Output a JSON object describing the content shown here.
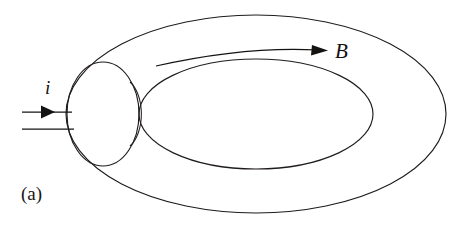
{
  "figure": {
    "kind": "physics-diagram",
    "panel_label": "(a)",
    "labels": {
      "current": "i",
      "field": "B"
    },
    "colors": {
      "background": "#ffffff",
      "outline": "#201c1b",
      "shading_light": "#dedede",
      "shading_mid": "#c8c8c8",
      "shading_dark": "#b4b4b4",
      "label": "#131010"
    },
    "annotations": {
      "current_arrow": "arrow pointing right into toroid windings",
      "field_arrow": "curved arrow following toroid axis clockwise",
      "cross_section_circle": "circular cross-section of toroid tube at left"
    },
    "geometry": {
      "outer_ellipse": {
        "cx": 256,
        "cy": 114,
        "rx": 190,
        "ry": 99
      },
      "inner_ellipse": {
        "cx": 256,
        "cy": 114,
        "rx": 117,
        "ry": 55
      },
      "cross_section_circle": {
        "cx": 103,
        "cy": 114,
        "rx": 36,
        "ry": 52
      }
    }
  }
}
